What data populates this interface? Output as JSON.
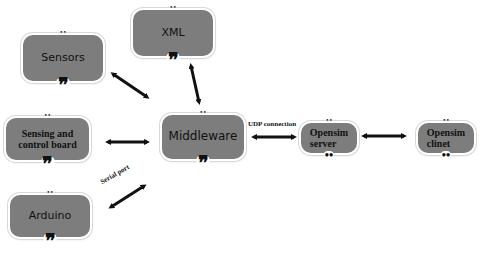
{
  "diagram": {
    "nodes": [
      {
        "id": "sensors",
        "label": "Sensors"
      },
      {
        "id": "xml",
        "label": "XML"
      },
      {
        "id": "sensing_control_board",
        "label_line1": "Sensing and",
        "label_line2": "control board"
      },
      {
        "id": "middleware",
        "label": "Middleware"
      },
      {
        "id": "arduino",
        "label": "Arduino"
      },
      {
        "id": "opensim_server",
        "label_line1": "Opensim",
        "label_line2": "server"
      },
      {
        "id": "opensim_client",
        "label_line1": "Opensim",
        "label_line2": "clinet"
      }
    ],
    "edges": [
      {
        "from": "sensors",
        "to": "middleware",
        "label": "",
        "direction": "bidirectional"
      },
      {
        "from": "xml",
        "to": "middleware",
        "label": "",
        "direction": "bidirectional"
      },
      {
        "from": "sensing_control_board",
        "to": "middleware",
        "label": "",
        "direction": "bidirectional"
      },
      {
        "from": "arduino",
        "to": "middleware",
        "label": "Serial port",
        "direction": "bidirectional"
      },
      {
        "from": "middleware",
        "to": "opensim_server",
        "label": "UDP connection",
        "direction": "bidirectional"
      },
      {
        "from": "opensim_server",
        "to": "opensim_client",
        "label": "",
        "direction": "bidirectional"
      }
    ],
    "edge_labels": {
      "serial": "Serial port",
      "udp": "UDP connection"
    },
    "decorations": {
      "top_dots": "••",
      "bottom_quote": "❞"
    },
    "colors": {
      "node_fill": "#7d7d7d",
      "arrow": "#111111",
      "background": "#ffffff"
    }
  }
}
